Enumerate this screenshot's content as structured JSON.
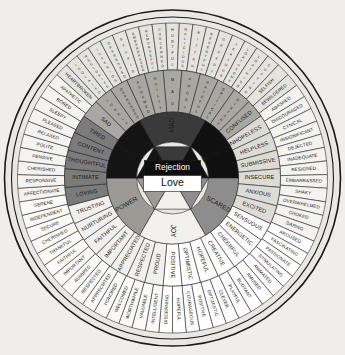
{
  "center": {
    "label": "Love",
    "text_color": "#111111",
    "fill": "#ffffff"
  },
  "colors": {
    "background": "#efeeea",
    "outline": "#1c1c1c",
    "rim": "#e9e8e3",
    "inner_dark": "#1b1b1b",
    "inner_mid": "#6e6e6e",
    "inner_light": "#d8d7d2",
    "mid_dark": "#7b7b7b",
    "mid_mid": "#a8a7a2",
    "mid_light": "#dcdbd6",
    "outer_light": "#f4f3ef",
    "outer_mid": "#e4e3de",
    "text_dark": "#141414",
    "text_light": "#f7f7f5"
  },
  "core_sectors": [
    {
      "label": "Mad",
      "fill": "#3a3a3a",
      "text": "#f2f2f2"
    },
    {
      "label": "Rejection",
      "fill": "#101010",
      "text": "#ffffff"
    },
    {
      "label": "Scared",
      "fill": "#8d8d8d",
      "text": "#1a1a1a"
    },
    {
      "label": "Joy",
      "fill": "#f2f1ed",
      "text": "#1a1a1a"
    },
    {
      "label": "Power",
      "fill": "#9b9a95",
      "text": "#1a1a1a"
    },
    {
      "label": "Peace",
      "fill": "#141414",
      "text": "#ffffff"
    }
  ],
  "sectors": [
    {
      "name": "mad",
      "core": "Mad",
      "fill_mid": "#8e8d88",
      "fill_outer": "#dddcd7",
      "middle": [
        "Hurt",
        "Hostile",
        "Angry",
        "Rage",
        "Critical"
      ],
      "outer": [
        [
          "Crushed",
          "Tormented"
        ],
        [
          "Infuriated",
          "Frustrated"
        ],
        [
          "Irritated",
          "Enraged"
        ],
        [
          "Hateful",
          "Furious"
        ],
        [
          "Sarcastic",
          "Skeptical"
        ]
      ]
    },
    {
      "name": "rejection",
      "core": "Rejection",
      "fill_mid": "#6f6e69",
      "fill_outer": "#e6e5e0",
      "middle": [
        "Distant",
        "Critical",
        "Hateful",
        "Angry",
        "Mad"
      ],
      "outer": [
        [
          "Selfish",
          "Cutting"
        ],
        [
          "Loathing",
          "Loathsome"
        ],
        [
          "Jealous",
          "Greedy"
        ],
        [
          "Resentful",
          "Bitter"
        ],
        [
          "Malicious",
          "Hurtful"
        ]
      ]
    },
    {
      "name": "sad",
      "core": "Sad",
      "fill_mid": "#97968f",
      "fill_outer": "#eeede8",
      "middle": [
        "Guilty",
        "Ashamed",
        "Depressed",
        "Lonely",
        "Sad",
        "Tired"
      ],
      "outer": [
        [
          "Concerned",
          "Remorseful"
        ],
        [
          "Embarrassed",
          "Stupid"
        ],
        [
          "Oppressed",
          "Inferior"
        ],
        [
          "Reclusive",
          "Isolated"
        ],
        [
          "Heartbroken",
          "Apathetic"
        ],
        [
          "Bored",
          "Sleepy"
        ]
      ]
    },
    {
      "name": "scared",
      "core": "Scared",
      "fill_mid": "#c9c8c3",
      "fill_outer": "#f6f5f1",
      "middle": [
        "Confused",
        "Hopeless",
        "Helpless",
        "Submissive",
        "Insecure",
        "Anxious"
      ],
      "outer": [
        [
          "Bewildered",
          "Abashed"
        ],
        [
          "Discouraged",
          "Cynical"
        ],
        [
          "Insignificant",
          "Dejected"
        ],
        [
          "Inadequate",
          "Resigned"
        ],
        [
          "Embarrassed",
          "Shaky"
        ],
        [
          "Overwhelmed",
          "Choked"
        ]
      ]
    },
    {
      "name": "joyful",
      "core": "Joy",
      "fill_mid": "#ffffff",
      "fill_outer": "#ffffff",
      "middle": [
        "Excited",
        "Sensuous",
        "Energetic",
        "Cheerful",
        "Creative",
        "Hopeful",
        "Optimistic"
      ],
      "outer": [
        [
          "Daring",
          "Aroused"
        ],
        [
          "Fascinating",
          "Passionate"
        ],
        [
          "Stimulating",
          "Animated"
        ],
        [
          "Amused",
          "Buoyant"
        ],
        [
          "Playful",
          "Clever"
        ],
        [
          "Positive",
          "Courageous"
        ],
        [
          "Hopeful",
          "Optimistic"
        ]
      ]
    },
    {
      "name": "powerful",
      "core": "Power",
      "fill_mid": "#f0efeb",
      "fill_outer": "#fbfaf7",
      "middle": [
        "Faithful",
        "Important",
        "Appreciated",
        "Respected",
        "Proud",
        "Aware",
        "Nurturing"
      ],
      "outer": [
        [
          "Discerning",
          "Intelligent"
        ],
        [
          "Worthwhile",
          "Valuable"
        ],
        [
          "Honored",
          "Welcomed"
        ],
        [
          "Appreciated",
          "Respected"
        ],
        [
          "Admired",
          "Important"
        ],
        [
          "Faithful",
          "Thankful"
        ],
        [
          "Cherished",
          "Secure"
        ]
      ]
    },
    {
      "name": "peaceful",
      "core": "Peace",
      "fill_mid": "#9a9993",
      "fill_outer": "#eceae6",
      "middle": [
        "Content",
        "Thoughtful",
        "Intimate",
        "Loving",
        "Trusting",
        "Nurturing"
      ],
      "outer": [
        [
          "Pleased",
          "Relaxed"
        ],
        [
          "Polite",
          "Pensive"
        ],
        [
          "Cherished",
          "Responsive"
        ],
        [
          "Affectionate",
          "Serene"
        ],
        [
          "Independent",
          "Secure"
        ],
        [
          "Cherished",
          "Thankful"
        ]
      ]
    }
  ],
  "inner_ring_labels": [
    "Mad",
    "Rejection",
    "Sad",
    "Peace",
    "Power",
    "Joy",
    "Scared"
  ],
  "middle_ring_labels": [
    "Mad",
    "Angry",
    "Hateful",
    "Critical",
    "Distant",
    "Confused",
    "Hopeless",
    "Helpless",
    "Submissive",
    "Insecure",
    "Anxious",
    "Excited",
    "Sensuous",
    "Energetic",
    "Cheerful",
    "Creative",
    "Hopeful",
    "Optimistic",
    "Positive",
    "Proud",
    "Respected",
    "Appreciated",
    "Important",
    "Faithful",
    "Nurturing",
    "Trusting",
    "Loving",
    "Intimate",
    "Thoughtful",
    "Content",
    "Tired",
    "Sad",
    "Lonely",
    "Depressed",
    "Ashamed",
    "Guilty"
  ],
  "outer_ring_labels": [
    "Hurtful",
    "Malicious",
    "Bitter",
    "Resentful",
    "Greedy",
    "Jealous",
    "Loathsome",
    "Loathing",
    "Cutting",
    "Selfish",
    "Bewildered",
    "Abashed",
    "Discouraged",
    "Cynical",
    "Insignificant",
    "Dejected",
    "Inadequate",
    "Resigned",
    "Embarrassed",
    "Shaky",
    "Overwhelmed",
    "Choked",
    "Daring",
    "Aroused",
    "Fascinating",
    "Passionate",
    "Stimulating",
    "Animated",
    "Amused",
    "Buoyant",
    "Playful",
    "Clever",
    "Optimistic",
    "Positive",
    "Courageous",
    "Hopeful",
    "Discerning",
    "Intelligent",
    "Valuable",
    "Worthwhile",
    "Welcomed",
    "Honored",
    "Appreciated",
    "Respected",
    "Admired",
    "Important",
    "Faithful",
    "Thankful",
    "Cherished",
    "Secure",
    "Independent",
    "Serene",
    "Affectionate",
    "Responsive",
    "Cherished",
    "Pensive",
    "Polite",
    "Relaxed",
    "Pleased",
    "Sleepy",
    "Bored",
    "Apathetic",
    "Heartbroken",
    "Isolated",
    "Reclusive",
    "Inferior",
    "Oppressed",
    "Stupid",
    "Embarrassed",
    "Remorseful",
    "Concerned"
  ]
}
